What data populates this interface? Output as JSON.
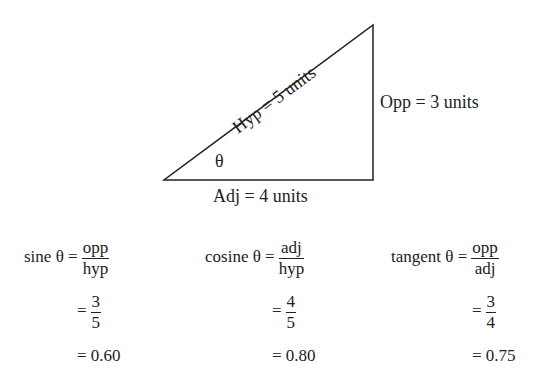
{
  "triangle": {
    "hyp_label": "Hyp = 5 units",
    "opp_label": "Opp = 3 units",
    "adj_label": "Adj = 4 units",
    "angle_label": "θ"
  },
  "equations": [
    {
      "name": "sine",
      "lhs": "sine θ =",
      "num": "opp",
      "den": "hyp",
      "eq": "=",
      "num2": "3",
      "den2": "5",
      "result": "= 0.60"
    },
    {
      "name": "cosine",
      "lhs": "cosine θ =",
      "num": "adj",
      "den": "hyp",
      "eq": "=",
      "num2": "4",
      "den2": "5",
      "result": "= 0.80"
    },
    {
      "name": "tangent",
      "lhs": "tangent θ =",
      "num": "opp",
      "den": "adj",
      "eq": "=",
      "num2": "3",
      "den2": "4",
      "result": "= 0.75"
    }
  ]
}
